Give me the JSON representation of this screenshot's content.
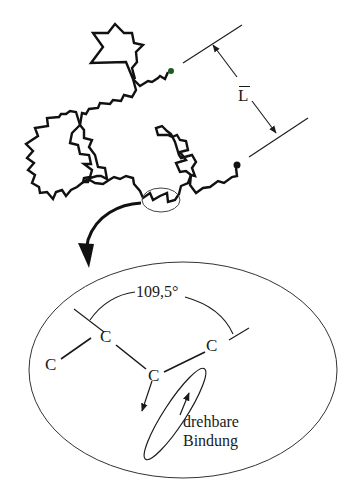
{
  "diagram": {
    "type": "polymer-chain-conformation",
    "colors": {
      "ink": "#1a1a1a",
      "end_dot_top": "#1f5a1f",
      "end_dot_bottom": "#111111",
      "background": "#ffffff"
    },
    "top": {
      "end_to_end_label": "L",
      "end_to_end_label_overbar": true,
      "description": "Random-coil polymer chain with end-to-end distance L between two chain ends (dots)"
    },
    "detail": {
      "atoms": [
        "C",
        "C",
        "C",
        "C"
      ],
      "bond_angle_label": "109,5°",
      "rotatable_bond_label_line1": "drehbare",
      "rotatable_bond_label_line2": "Bindung"
    }
  }
}
